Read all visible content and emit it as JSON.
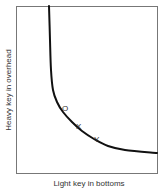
{
  "chart_data": {
    "type": "line",
    "title": "",
    "xlabel": "Light key in bottoms",
    "ylabel": "Heavy key in overhead",
    "grid": false,
    "legend": null,
    "axis_ticks": false,
    "series": [
      {
        "name": "separation curve",
        "description": "hyperbola-like curve, steep near left then flattening to the right",
        "points_px": [
          [
            49,
            6
          ],
          [
            50,
            40
          ],
          [
            51,
            70
          ],
          [
            53,
            90
          ],
          [
            57,
            102
          ],
          [
            63,
            112
          ],
          [
            72,
            122
          ],
          [
            82,
            131
          ],
          [
            94,
            139
          ],
          [
            108,
            146
          ],
          [
            125,
            150
          ],
          [
            157,
            153
          ]
        ]
      }
    ],
    "annotations": [
      {
        "label": "O",
        "x_px": 62,
        "y_px": 111
      },
      {
        "label": "X",
        "x_px": 76,
        "y_px": 129
      },
      {
        "label": "Y",
        "x_px": 94,
        "y_px": 142
      }
    ]
  },
  "colors": {
    "frame": "#555555",
    "curve": "#111111",
    "text": "#333333"
  }
}
